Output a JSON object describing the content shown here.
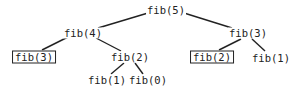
{
  "diagram": {
    "nodes": [
      {
        "id": "n5",
        "label": "fib(5)",
        "x": 166,
        "y": 10,
        "boxed": false
      },
      {
        "id": "n4",
        "label": "fib(4)",
        "x": 83,
        "y": 33,
        "boxed": false
      },
      {
        "id": "n3r",
        "label": "fib(3)",
        "x": 248,
        "y": 33,
        "boxed": false
      },
      {
        "id": "n3l",
        "label": "fib(3)",
        "x": 34,
        "y": 57,
        "boxed": true
      },
      {
        "id": "n2m",
        "label": "fib(2)",
        "x": 130,
        "y": 57,
        "boxed": false
      },
      {
        "id": "n2r",
        "label": "fib(2)",
        "x": 212,
        "y": 57,
        "boxed": true
      },
      {
        "id": "n1r",
        "label": "fib(1)",
        "x": 271,
        "y": 58,
        "boxed": false
      },
      {
        "id": "n1b",
        "label": "fib(1)",
        "x": 107,
        "y": 80,
        "boxed": false
      },
      {
        "id": "n0",
        "label": "fib(0)",
        "x": 148,
        "y": 80,
        "boxed": false
      }
    ],
    "edges": [
      {
        "from": "n5",
        "to": "n4",
        "x1": 148,
        "y1": 13,
        "x2": 98,
        "y2": 28
      },
      {
        "from": "n5",
        "to": "n3r",
        "x1": 184,
        "y1": 13,
        "x2": 232,
        "y2": 28
      },
      {
        "from": "n4",
        "to": "n3l",
        "x1": 68,
        "y1": 37,
        "x2": 42,
        "y2": 50
      },
      {
        "from": "n4",
        "to": "n2m",
        "x1": 96,
        "y1": 38,
        "x2": 121,
        "y2": 51
      },
      {
        "from": "n3r",
        "to": "n2r",
        "x1": 241,
        "y1": 39,
        "x2": 219,
        "y2": 50
      },
      {
        "from": "n3r",
        "to": "n1r",
        "x1": 252,
        "y1": 39,
        "x2": 265,
        "y2": 51
      },
      {
        "from": "n2m",
        "to": "n1b",
        "x1": 124,
        "y1": 63,
        "x2": 111,
        "y2": 74
      },
      {
        "from": "n2m",
        "to": "n0",
        "x1": 135,
        "y1": 63,
        "x2": 143,
        "y2": 74
      }
    ],
    "colors": {
      "stroke": "#222222",
      "text": "#222222",
      "background": "#ffffff"
    }
  }
}
